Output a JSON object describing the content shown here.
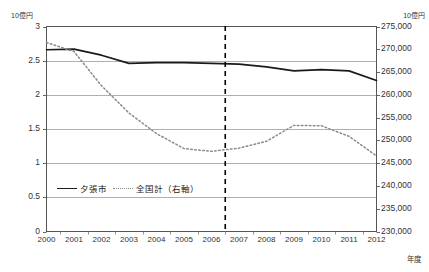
{
  "chart_data": {
    "type": "line",
    "title": "",
    "xlabel": "年度",
    "unit_left": "10億円",
    "unit_right": "10億円",
    "categories": [
      "2000",
      "2001",
      "2002",
      "2003",
      "2004",
      "2005",
      "2006",
      "2007",
      "2008",
      "2009",
      "2010",
      "2011",
      "2012"
    ],
    "ylim_left": [
      0,
      3
    ],
    "yticks_left": [
      "0",
      "0.5",
      "1",
      "1.5",
      "2",
      "2.5",
      "3"
    ],
    "ylim_right": [
      230000,
      275000
    ],
    "yticks_right": [
      "230,000",
      "235,000",
      "240,000",
      "245,000",
      "250,000",
      "255,000",
      "260,000",
      "265,000",
      "270,000",
      "275,000"
    ],
    "grid": true,
    "legend_position": "inside-bottom-left",
    "annotations": [
      {
        "type": "vertical-dashed-line",
        "between": [
          "2006",
          "2007"
        ],
        "label": ""
      }
    ],
    "series": [
      {
        "name": "夕張市",
        "axis": "left",
        "style": "solid",
        "color": "#1a1a1a",
        "values": [
          2.66,
          2.67,
          2.58,
          2.46,
          2.47,
          2.47,
          2.46,
          2.45,
          2.41,
          2.35,
          2.37,
          2.35,
          2.21
        ]
      },
      {
        "name": "全国計（右軸）",
        "axis": "right",
        "style": "dotted",
        "color": "#8a8a8a",
        "values": [
          271500,
          269500,
          262000,
          256000,
          251500,
          248200,
          247600,
          248300,
          249800,
          253300,
          253200,
          250900,
          246600
        ]
      }
    ]
  },
  "legend": {
    "items": [
      {
        "label": "夕張市",
        "style": "solid"
      },
      {
        "label": "全国計（右軸）",
        "style": "dotted"
      }
    ]
  }
}
